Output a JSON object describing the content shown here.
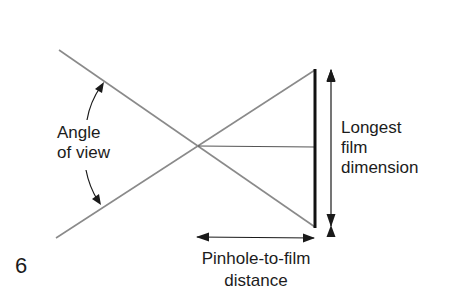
{
  "figure": {
    "number": "6",
    "colors": {
      "ray_line": "#8a8a8a",
      "film_line": "#111111",
      "arrow": "#1a1a1a",
      "text": "#1c1c1c",
      "background": "#ffffff"
    }
  },
  "labels": {
    "angle_of_view": [
      "Angle",
      "of view"
    ],
    "longest_film_dimension": [
      "Longest",
      "film",
      "dimension"
    ],
    "pinhole_to_film_distance": [
      "Pinhole-to-film",
      "distance"
    ]
  }
}
